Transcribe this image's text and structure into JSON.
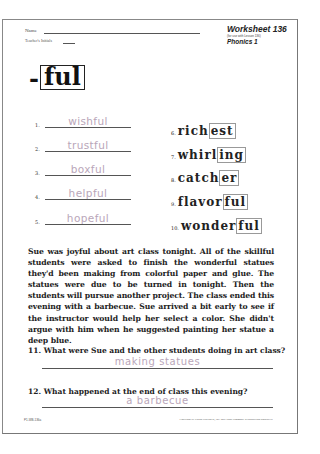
{
  "header": {
    "name_label": "Name",
    "teacher_label": "Teacher's Initials",
    "worksheet_title": "Worksheet 136",
    "worksheet_subtitle": "(for use with Lesson 136)",
    "program": "Phonics 1"
  },
  "suffix": {
    "dash": "-",
    "text": "ful"
  },
  "left_items": [
    {
      "num": "1.",
      "answer": "wishful"
    },
    {
      "num": "2.",
      "answer": "trustful"
    },
    {
      "num": "3.",
      "answer": "boxful"
    },
    {
      "num": "4.",
      "answer": "helpful"
    },
    {
      "num": "5.",
      "answer": "hopeful"
    }
  ],
  "right_items": [
    {
      "num": "6.",
      "pre": "rich",
      "boxed": "est"
    },
    {
      "num": "7.",
      "pre": "whirl",
      "boxed": "ing"
    },
    {
      "num": "8.",
      "pre": "catch",
      "boxed": "er"
    },
    {
      "num": "9.",
      "pre": "flavor",
      "boxed": "ful"
    },
    {
      "num": "10.",
      "pre": "wonder",
      "boxed": "ful"
    }
  ],
  "passage": "Sue was joyful about art class tonight. All of the skillful students were asked to finish the wonderful statues they'd been making from colorful paper and glue. The statues were due to be turned in tonight. Then the students will pursue another project. The class ended this evening with a barbecue. Sue arrived a bit early to see if the instructor would help her select a color. She didn't argue with him when he suggested painting her statue a deep blue.",
  "questions": [
    {
      "label": "11. What were Sue and the other students doing in art class?",
      "answer": "making statues"
    },
    {
      "label": "12. What happened at the end of class this evening?",
      "answer": "a barbecue"
    }
  ],
  "footer": {
    "code": "P1-WB-136a",
    "copyright": "Copyright by Saxon Publishers, Inc. and Lorna Simmons. Reproduction prohibited."
  }
}
